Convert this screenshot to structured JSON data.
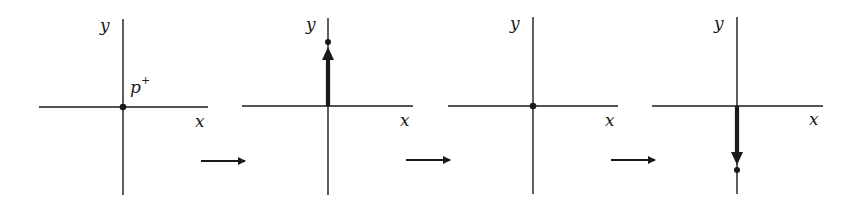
{
  "diagram": {
    "type": "sequence of coordinate frames showing a charge oscillating along y",
    "ink_color": "#1a1a1a",
    "background": "#ffffff",
    "panels": [
      {
        "id": 1,
        "x_label": "x",
        "y_label": "y",
        "particle_label": "p",
        "particle_superscript": "+",
        "particle_position": "origin",
        "vector": "none"
      },
      {
        "id": 2,
        "x_label": "x",
        "y_label": "y",
        "particle_position": "+y",
        "vector": "up"
      },
      {
        "id": 3,
        "x_label": "x",
        "y_label": "y",
        "particle_position": "origin",
        "vector": "none"
      },
      {
        "id": 4,
        "x_label": "x",
        "y_label": "y",
        "particle_position": "-y",
        "vector": "down"
      }
    ],
    "transitions": [
      "right-arrow",
      "right-arrow",
      "right-arrow"
    ]
  }
}
